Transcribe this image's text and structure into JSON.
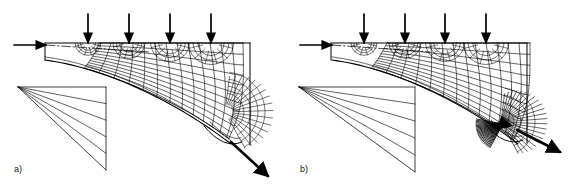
{
  "figure": {
    "background_color": "#ffffff",
    "line_color": "#000000",
    "width": 573,
    "height": 191
  },
  "panels": [
    {
      "id": "a",
      "label": "a)",
      "label_x": 14,
      "label_y": 172,
      "origin_x": 0,
      "entry_arrow": {
        "name": "entry-load-arrow",
        "direction": "right",
        "x1": 14,
        "y1": 45,
        "x2": 46,
        "y2": 45
      },
      "exit_arrow": {
        "name": "exit-flow-arrow",
        "direction": "down-right",
        "x1": 231,
        "y1": 142,
        "x2": 268,
        "y2": 176,
        "thick": true
      },
      "top_arrows": {
        "name": "distributed-load-arrows",
        "count": 4,
        "direction": "down",
        "x_positions": [
          88,
          129,
          170,
          211
        ],
        "y_start": 14,
        "y_end": 43
      },
      "body": {
        "top_edge_y": 43,
        "left_edge_x": 45,
        "right_edge_x": 250,
        "bottom_left_y": 60,
        "centerline": {
          "name": "centerline",
          "style": "dash-dot",
          "x1": 46,
          "y1": 45,
          "x2": 150,
          "y2": 52
        }
      },
      "net": {
        "alpha_lines": 13,
        "beta_lines": 11,
        "fan_centers": 4,
        "converged": false
      },
      "hodograph": {
        "name": "hodograph-fan",
        "apex_x": 18,
        "apex_y": 87,
        "rays": 4,
        "right_edge_x": 106,
        "top_y": 87,
        "bottom_y": 170
      }
    },
    {
      "id": "b",
      "label": "b)",
      "label_x": 300,
      "label_y": 172,
      "origin_x": 287,
      "entry_arrow": {
        "name": "entry-load-arrow",
        "direction": "right",
        "x1": 300,
        "y1": 45,
        "x2": 332,
        "y2": 45
      },
      "exit_arrow": {
        "name": "exit-flow-arrow",
        "direction": "down-right",
        "x1": 517,
        "y1": 130,
        "x2": 560,
        "y2": 152,
        "thick": true
      },
      "top_arrows": {
        "name": "distributed-load-arrows",
        "count": 4,
        "direction": "down",
        "x_positions": [
          364,
          405,
          445,
          486
        ],
        "y_start": 14,
        "y_end": 43
      },
      "body": {
        "top_edge_y": 43,
        "left_edge_x": 331,
        "right_edge_x": 527,
        "bottom_left_y": 60,
        "centerline": {
          "name": "centerline",
          "style": "dash-dot",
          "x1": 332,
          "y1": 45,
          "x2": 430,
          "y2": 52
        }
      },
      "net": {
        "alpha_lines": 13,
        "beta_lines": 11,
        "fan_centers": 4,
        "converged": true,
        "convergence_point_x": 503,
        "convergence_point_y": 124
      },
      "hodograph": {
        "name": "hodograph-fan",
        "apex_x": 299,
        "apex_y": 87,
        "rays": 4,
        "right_edge_x": 415,
        "top_y": 87,
        "bottom_y": 172
      }
    }
  ]
}
